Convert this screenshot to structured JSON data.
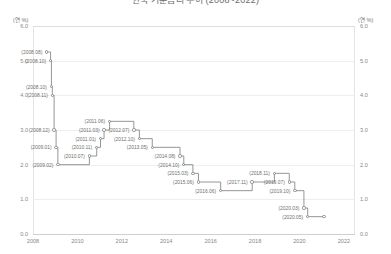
{
  "title": "한국 기준금리 추이 (2008~2022)",
  "axis": {
    "unit_left": "(연 %)",
    "unit_right": "(연 %)",
    "y_ticks": [
      "6.0",
      "5.0",
      "4.0",
      "3.0",
      "2.0",
      "1.0",
      "0.0"
    ],
    "x_ticks": [
      "2008",
      "2010",
      "2012",
      "2014",
      "2016",
      "2018",
      "2020",
      "2022"
    ]
  },
  "chart_data": {
    "type": "line",
    "title": "한국 기준금리 추이 (2008~2022)",
    "xlabel": "",
    "ylabel": "(연 %)",
    "ylim": [
      0.0,
      6.0
    ],
    "xlim": [
      2008.0,
      2022.5
    ],
    "grid": true,
    "legend": null,
    "line_style": "step-post",
    "marker": "circle",
    "series": [
      {
        "name": "기준금리",
        "color": "#8a8a8a",
        "points": [
          {
            "label": "(2008.08)",
            "x": 2008.62,
            "y": 5.25,
            "label_side": "left"
          },
          {
            "label": "(2008.10)",
            "x": 2008.79,
            "y": 5.0,
            "label_side": "left"
          },
          {
            "label": "(2008.10)",
            "x": 2008.83,
            "y": 4.25,
            "label_side": "left"
          },
          {
            "label": "(2008.11)",
            "x": 2008.87,
            "y": 4.0,
            "label_side": "left"
          },
          {
            "label": "(2008.12)",
            "x": 2008.95,
            "y": 3.0,
            "label_side": "left"
          },
          {
            "label": "(2009.01)",
            "x": 2009.04,
            "y": 2.5,
            "label_side": "left"
          },
          {
            "label": "(2009.02)",
            "x": 2009.12,
            "y": 2.0,
            "label_side": "left"
          },
          {
            "label": "(2010.07)",
            "x": 2010.54,
            "y": 2.25,
            "label_side": "left"
          },
          {
            "label": "(2010.11)",
            "x": 2010.87,
            "y": 2.5,
            "label_side": "left"
          },
          {
            "label": "(2011.01)",
            "x": 2011.04,
            "y": 2.75,
            "label_side": "left"
          },
          {
            "label": "(2011.03)",
            "x": 2011.2,
            "y": 3.0,
            "label_side": "left"
          },
          {
            "label": "(2011.06)",
            "x": 2011.45,
            "y": 3.25,
            "label_side": "left"
          },
          {
            "label": "(2012.07)",
            "x": 2012.54,
            "y": 3.0,
            "label_side": "left"
          },
          {
            "label": "(2012.10)",
            "x": 2012.79,
            "y": 2.75,
            "label_side": "left"
          },
          {
            "label": "(2013.05)",
            "x": 2013.37,
            "y": 2.5,
            "label_side": "left"
          },
          {
            "label": "(2014.08)",
            "x": 2014.62,
            "y": 2.25,
            "label_side": "left"
          },
          {
            "label": "(2014.10)",
            "x": 2014.79,
            "y": 2.0,
            "label_side": "left"
          },
          {
            "label": "(2015.03)",
            "x": 2015.2,
            "y": 1.75,
            "label_side": "left"
          },
          {
            "label": "(2015.06)",
            "x": 2015.45,
            "y": 1.5,
            "label_side": "left"
          },
          {
            "label": "(2016.06)",
            "x": 2016.45,
            "y": 1.25,
            "label_side": "left"
          },
          {
            "label": "(2017.11)",
            "x": 2017.87,
            "y": 1.5,
            "label_side": "left"
          },
          {
            "label": "(2018.11)",
            "x": 2018.87,
            "y": 1.75,
            "label_side": "left"
          },
          {
            "label": "(2019.07)",
            "x": 2019.54,
            "y": 1.5,
            "label_side": "left"
          },
          {
            "label": "(2019.10)",
            "x": 2019.79,
            "y": 1.25,
            "label_side": "left"
          },
          {
            "label": "(2020.03)",
            "x": 2020.2,
            "y": 0.75,
            "label_side": "left"
          },
          {
            "label": "(2020.05)",
            "x": 2020.37,
            "y": 0.5,
            "label_side": "left"
          },
          {
            "label": "",
            "x": 2021.1,
            "y": 0.5,
            "label_side": "none"
          }
        ]
      }
    ]
  }
}
